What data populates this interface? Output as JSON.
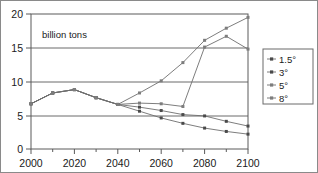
{
  "chart_data": {
    "type": "line",
    "title": "",
    "subtitle": "",
    "annotation": "billion tons",
    "xlabel": "",
    "ylabel": "",
    "xlim": [
      2000,
      2100
    ],
    "ylim": [
      0,
      20
    ],
    "grid": true,
    "legend_position": "right-outside",
    "x": [
      2000,
      2010,
      2020,
      2030,
      2040,
      2050,
      2060,
      2070,
      2080,
      2090,
      2100
    ],
    "xticks": [
      2000,
      2020,
      2040,
      2060,
      2080,
      2100
    ],
    "xtick_labels": [
      "2000",
      "2020",
      "2040",
      "2060",
      "2080",
      "2100"
    ],
    "xminor_ticks": [
      2010,
      2030,
      2050,
      2070,
      2090
    ],
    "yticks": [
      0,
      5,
      10,
      15,
      20
    ],
    "ytick_labels": [
      "0",
      "5",
      "10",
      "15",
      "20"
    ],
    "series": [
      {
        "name": "1.5°",
        "marker": "square",
        "values": [
          6.7,
          8.3,
          8.8,
          7.6,
          6.6,
          5.6,
          4.6,
          3.8,
          3.1,
          2.6,
          2.2
        ]
      },
      {
        "name": "3°",
        "marker": "square",
        "values": [
          6.7,
          8.3,
          8.8,
          7.6,
          6.6,
          6.2,
          5.7,
          5.1,
          4.9,
          4.1,
          3.4
        ]
      },
      {
        "name": "5°",
        "marker": "square",
        "values": [
          6.7,
          8.3,
          8.8,
          7.6,
          6.6,
          6.8,
          6.7,
          6.3,
          15.1,
          16.7,
          14.8
        ]
      },
      {
        "name": "8°",
        "marker": "square",
        "values": [
          6.7,
          8.3,
          8.8,
          7.6,
          6.6,
          8.3,
          10.1,
          12.8,
          16.1,
          17.9,
          19.5
        ]
      }
    ],
    "legend_entries": [
      "1.5°",
      "3°",
      "5°",
      "8°"
    ],
    "colors": {
      "line": "#6e6e6e",
      "marker": "#4a4a4a",
      "grid": "#5a5a5a",
      "frame": "#5a5a5a",
      "text": "#1a1a1a",
      "background": "#ffffff"
    }
  }
}
